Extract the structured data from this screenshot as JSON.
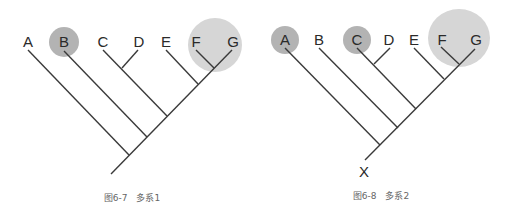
{
  "figures": [
    {
      "id": "fig-6-7",
      "caption": "图6-7　多系1",
      "taxa": [
        "A",
        "B",
        "C",
        "D",
        "E",
        "F",
        "G"
      ],
      "root_label": "",
      "highlighted": [
        "B",
        "F+G"
      ]
    },
    {
      "id": "fig-6-8",
      "caption": "图6-8　多系2",
      "taxa": [
        "A",
        "B",
        "C",
        "D",
        "E",
        "F",
        "G"
      ],
      "root_label": "X",
      "highlighted": [
        "A",
        "C",
        "F+G"
      ]
    }
  ],
  "colors": {
    "line": "#3a3a3a",
    "highlight_dark": "#b3b3b3",
    "highlight_light": "#d6d6d6",
    "caption": "#666666"
  }
}
